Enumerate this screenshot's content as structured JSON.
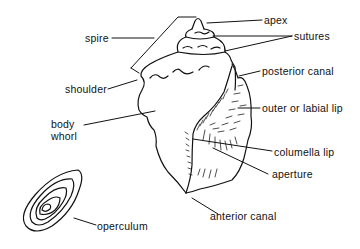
{
  "diagram": {
    "labels": {
      "apex": "apex",
      "sutures": "sutures",
      "spire": "spire",
      "posterior_canal": "posterior canal",
      "shoulder": "shoulder",
      "outer_lip": "outer or labial lip",
      "body_whorl_line1": "body",
      "body_whorl_line2": "whorl",
      "columella_lip": "columella lip",
      "aperture": "aperture",
      "anterior_canal": "anterior canal",
      "operculum": "operculum"
    },
    "colors": {
      "line": "#111111",
      "background": "#ffffff"
    }
  }
}
